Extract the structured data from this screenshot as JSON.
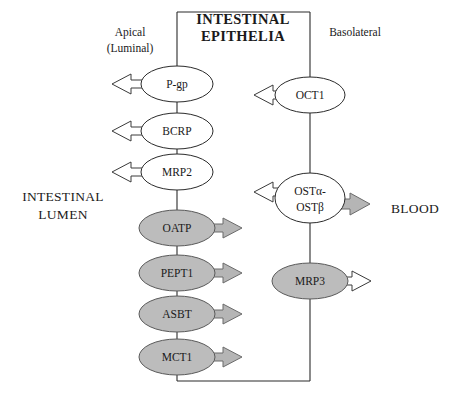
{
  "figure": {
    "title_line1": "INTESTINAL",
    "title_line2": "EPITHELIA",
    "membrane_labels": {
      "apical_line1": "Apical",
      "apical_line2": "(Luminal)",
      "basolateral": "Basolateral"
    },
    "compartments": {
      "left_line1": "INTESTINAL",
      "left_line2": "LUMEN",
      "right": "BLOOD"
    },
    "colors": {
      "efflux_fill": "#ffffff",
      "uptake_fill": "#bcbcbc",
      "arrow_gray": "#b5b5b5",
      "arrow_white": "#ffffff",
      "stroke": "#2b2b2b"
    },
    "apical_transporters": [
      {
        "label": "P-gp",
        "fill": "white",
        "arrow_dir": "left",
        "arrow_fill": "white"
      },
      {
        "label": "BCRP",
        "fill": "white",
        "arrow_dir": "left",
        "arrow_fill": "white"
      },
      {
        "label": "MRP2",
        "fill": "white",
        "arrow_dir": "left",
        "arrow_fill": "white"
      },
      {
        "label": "OATP",
        "fill": "gray",
        "arrow_dir": "right",
        "arrow_fill": "gray"
      },
      {
        "label": "PEPT1",
        "fill": "gray",
        "arrow_dir": "right",
        "arrow_fill": "gray"
      },
      {
        "label": "ASBT",
        "fill": "gray",
        "arrow_dir": "right",
        "arrow_fill": "gray"
      },
      {
        "label": "MCT1",
        "fill": "gray",
        "arrow_dir": "right",
        "arrow_fill": "gray"
      }
    ],
    "basolateral_transporters": [
      {
        "label": "OCT1",
        "label_line2": "",
        "fill": "white",
        "arrow_dir": "left",
        "arrow_fill": "white"
      },
      {
        "label": "OSTα-",
        "label_line2": "OSTβ",
        "fill": "white",
        "arrow_dir": "both",
        "arrow_fill": "white-and-gray"
      },
      {
        "label": "MRP3",
        "label_line2": "",
        "fill": "gray",
        "arrow_dir": "right",
        "arrow_fill": "white"
      }
    ]
  }
}
